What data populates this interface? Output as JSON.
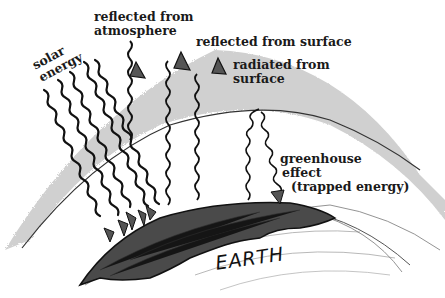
{
  "diagram": {
    "title": "Greenhouse effect",
    "labels": {
      "solar_energy": [
        "solar",
        "energy"
      ],
      "reflected_from_atmosphere": [
        "reflected from",
        "atmosphere"
      ],
      "reflected_from_surface": "reflected from surface",
      "radiated_from_surface": [
        "radiated from",
        "surface"
      ],
      "greenhouse_effect": [
        "greenhouse",
        "effect",
        "(trapped energy)"
      ],
      "earth": "EARTH"
    },
    "colors": {
      "atmosphere_band": "#c9c9c9",
      "ink": "#111111",
      "land": "#4a4a4a",
      "background": "#ffffff"
    },
    "elements": {
      "incoming_solar_rays": 6,
      "reflected_from_atmosphere_arrows": 1,
      "reflected_from_surface_arrows": 1,
      "radiated_from_surface_arrows": 1,
      "trapped_energy_arrows": 1
    }
  }
}
